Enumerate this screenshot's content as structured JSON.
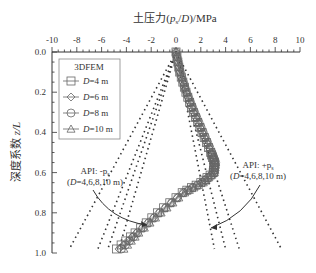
{
  "chart_data": {
    "type": "line",
    "title": "",
    "xlabel": "土压力(p_s/D)/MPa",
    "ylabel": "深度系数 z/L",
    "xlim": [
      -10,
      10
    ],
    "ylim": [
      1.0,
      0.0
    ],
    "xticks": [
      "-10",
      "-8",
      "-6",
      "-4",
      "-2",
      "0",
      "2",
      "4",
      "6",
      "8",
      "10"
    ],
    "yticks": [
      "0.0",
      "0.2",
      "0.4",
      "0.6",
      "0.8",
      "1.0"
    ],
    "legend": {
      "title": "3DFEM",
      "position": "upper-left",
      "entries": [
        "D=4 m",
        "D=6 m",
        "D=8 m",
        "D=10 m"
      ]
    },
    "annotations": [
      {
        "text_line1": "API: -p_s",
        "text_line2": "(D=4,6,8,10 m)"
      },
      {
        "text_line1": "API: +p_s",
        "text_line2": "(D=4,6,8,10 m)"
      }
    ],
    "series": [
      {
        "name": "3DFEM D=4 m",
        "marker": "square",
        "z": [
          0,
          0.1,
          0.2,
          0.3,
          0.4,
          0.5,
          0.55,
          0.6,
          0.65,
          0.7,
          0.8,
          0.9,
          0.98
        ],
        "values": [
          0,
          0.3,
          0.8,
          1.4,
          2.1,
          2.8,
          3.1,
          3.0,
          2.0,
          0.5,
          -1.5,
          -3.3,
          -4.8
        ]
      },
      {
        "name": "3DFEM D=6 m",
        "marker": "diamond",
        "z": [
          0,
          0.1,
          0.2,
          0.3,
          0.4,
          0.5,
          0.55,
          0.6,
          0.65,
          0.7,
          0.8,
          0.9,
          0.98
        ],
        "values": [
          0,
          0.3,
          0.8,
          1.4,
          2.1,
          2.8,
          3.1,
          3.0,
          2.0,
          0.6,
          -1.4,
          -3.2,
          -4.6
        ]
      },
      {
        "name": "3DFEM D=8 m",
        "marker": "circle",
        "z": [
          0,
          0.1,
          0.2,
          0.3,
          0.4,
          0.5,
          0.55,
          0.6,
          0.65,
          0.7,
          0.8,
          0.9,
          0.98
        ],
        "values": [
          0,
          0.35,
          0.85,
          1.5,
          2.2,
          2.9,
          3.2,
          3.1,
          2.1,
          0.6,
          -1.3,
          -3.1,
          -4.4
        ]
      },
      {
        "name": "3DFEM D=10 m",
        "marker": "triangle",
        "z": [
          0,
          0.1,
          0.2,
          0.3,
          0.4,
          0.5,
          0.55,
          0.6,
          0.65,
          0.7,
          0.8,
          0.9,
          0.98
        ],
        "values": [
          0,
          0.35,
          0.9,
          1.5,
          2.2,
          2.9,
          3.2,
          3.1,
          2.2,
          0.7,
          -1.2,
          -3.0,
          -4.2
        ]
      },
      {
        "name": "API +p_s D=4 m",
        "style": "dotted",
        "z": [
          0,
          0.98
        ],
        "values": [
          0,
          3.1
        ]
      },
      {
        "name": "API +p_s D=6 m",
        "style": "dotted",
        "z": [
          0,
          0.98
        ],
        "values": [
          0,
          4.0
        ]
      },
      {
        "name": "API +p_s D=8 m",
        "style": "dotted",
        "z": [
          0,
          0.98
        ],
        "values": [
          0,
          5.1
        ]
      },
      {
        "name": "API +p_s D=10 m",
        "style": "dotted",
        "z": [
          0,
          0.98
        ],
        "values": [
          0,
          8.5
        ]
      },
      {
        "name": "API -p_s D=4 m",
        "style": "dotted",
        "z": [
          0,
          0.98
        ],
        "values": [
          0,
          -4.6
        ]
      },
      {
        "name": "API -p_s D=6 m",
        "style": "dotted",
        "z": [
          0,
          0.98
        ],
        "values": [
          0,
          -5.5
        ]
      },
      {
        "name": "API -p_s D=8 m",
        "style": "dotted",
        "z": [
          0,
          0.98
        ],
        "values": [
          0,
          -6.3
        ]
      },
      {
        "name": "API -p_s D=10 m",
        "style": "dotted",
        "z": [
          0,
          0.98
        ],
        "values": [
          0,
          -8.6
        ]
      }
    ]
  },
  "labels": {
    "xlabel_main": "土压力(",
    "xlabel_p": "p",
    "xlabel_sub": "s",
    "xlabel_rest": "/",
    "xlabel_D": "D",
    "xlabel_unit": ")/MPa",
    "ylabel_cn": "深度系数",
    "ylabel_var": "z",
    "ylabel_L": "/L",
    "legend_title": "3DFEM",
    "legend_d": "D",
    "legend_v1": "=4 m",
    "legend_v2": "=6 m",
    "legend_v3": "=8 m",
    "legend_v4": "=10 m",
    "ann_left_1": "API: -p",
    "ann_right_1": "API: +p",
    "ann_sub": "s",
    "ann_line2_open": "(",
    "ann_line2_D": "D",
    "ann_line2_rest": "=4,6,8,10 m)"
  }
}
